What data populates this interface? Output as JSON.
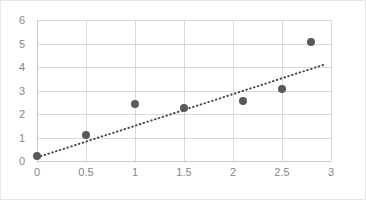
{
  "chart_data": {
    "type": "scatter",
    "title": "",
    "xlabel": "",
    "ylabel": "",
    "xlim": [
      0,
      3
    ],
    "ylim": [
      0,
      6
    ],
    "grid": true,
    "legend": "none",
    "x_ticks": [
      "0",
      "0.5",
      "1",
      "1.5",
      "2",
      "2.5",
      "3"
    ],
    "x_tick_values": [
      0,
      0.5,
      1,
      1.5,
      2,
      2.5,
      3
    ],
    "y_ticks": [
      "0",
      "1",
      "2",
      "3",
      "4",
      "5",
      "6"
    ],
    "y_tick_values": [
      0,
      1,
      2,
      3,
      4,
      5,
      6
    ],
    "series": [
      {
        "name": "data-points",
        "marker": "circle",
        "color": "#595959",
        "points": [
          {
            "x": 0,
            "y": 0.2
          },
          {
            "x": 0.5,
            "y": 1.1
          },
          {
            "x": 1,
            "y": 2.42
          },
          {
            "x": 1.5,
            "y": 2.25
          },
          {
            "x": 2.1,
            "y": 2.57
          },
          {
            "x": 2.5,
            "y": 3.05
          },
          {
            "x": 2.8,
            "y": 5.05
          }
        ]
      },
      {
        "name": "trendline",
        "style": "dotted",
        "color": "#4a4a4a",
        "points": [
          {
            "x": 0,
            "y": 0.15
          },
          {
            "x": 2.93,
            "y": 4.1
          }
        ]
      }
    ]
  },
  "colors": {
    "marker": "#595959",
    "trendline": "#4a4a4a",
    "gridline": "#d9d9d9",
    "axis": "#c9c9c9",
    "tick_text": "#868686",
    "frame_border": "#e8e8e8",
    "background": "#ffffff"
  }
}
